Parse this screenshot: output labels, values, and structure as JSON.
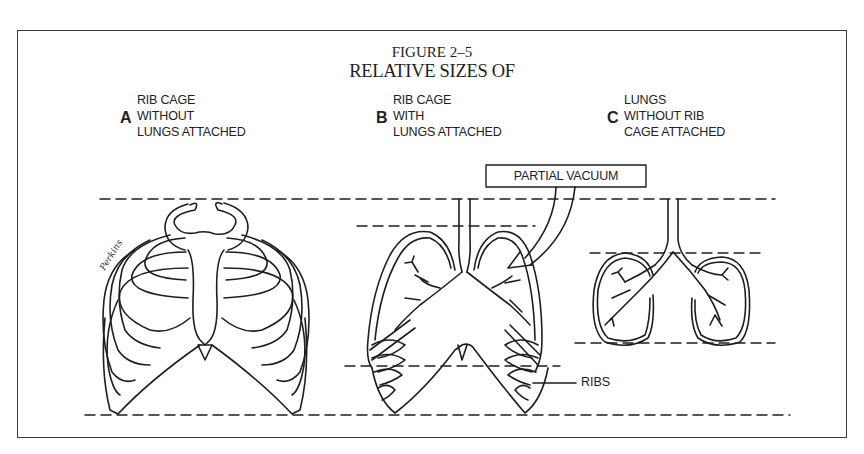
{
  "figure": {
    "number": "FIGURE 2–5",
    "title": "RELATIVE SIZES OF"
  },
  "panels": [
    {
      "letter": "A",
      "lines": [
        "RIB CAGE",
        "WITHOUT",
        "LUNGS ATTACHED"
      ]
    },
    {
      "letter": "B",
      "lines": [
        "RIB CAGE",
        "WITH",
        "LUNGS ATTACHED"
      ]
    },
    {
      "letter": "C",
      "lines": [
        "LUNGS",
        "WITHOUT RIB",
        "CAGE ATTACHED"
      ]
    }
  ],
  "annotations": {
    "partial_vacuum": "PARTIAL VACUUM",
    "ribs": "RIBS"
  },
  "signature": "Perkins",
  "colors": {
    "ink": "#1e1e1e",
    "frame": "#3a3a3a",
    "background": "#ffffff"
  }
}
